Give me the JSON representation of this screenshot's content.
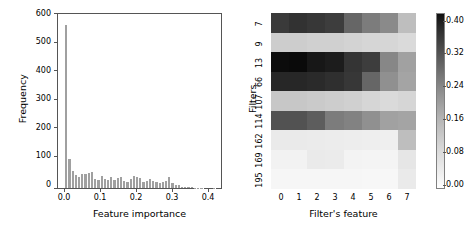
{
  "figure": {
    "panels": [
      "histogram",
      "heatmap"
    ],
    "background_color": "#ffffff"
  },
  "chart_data": [
    {
      "type": "bar",
      "subtype": "histogram",
      "title": "",
      "xlabel": "Feature importance",
      "ylabel": "Frequency",
      "xlim": [
        -0.02,
        0.44
      ],
      "ylim": [
        0,
        620
      ],
      "xticks": [
        "0.0",
        "0.1",
        "0.2",
        "0.3",
        "0.4"
      ],
      "xtick_values": [
        0.0,
        0.1,
        0.2,
        0.3,
        0.4
      ],
      "yticks": [
        "0",
        "100",
        "200",
        "300",
        "400",
        "500",
        "600"
      ],
      "ytick_values": [
        0,
        100,
        200,
        300,
        400,
        500,
        600
      ],
      "grid": false,
      "legend": null,
      "bar_color": "#a0a0a0",
      "bin_edges": [
        0.0,
        0.009,
        0.018,
        0.027,
        0.036,
        0.045,
        0.054,
        0.063,
        0.072,
        0.081,
        0.09,
        0.099,
        0.108,
        0.117,
        0.126,
        0.135,
        0.144,
        0.153,
        0.162,
        0.171,
        0.18,
        0.189,
        0.198,
        0.207,
        0.216,
        0.225,
        0.234,
        0.243,
        0.252,
        0.261,
        0.27,
        0.279,
        0.288,
        0.297,
        0.306,
        0.315,
        0.324,
        0.333,
        0.342,
        0.351,
        0.36,
        0.369,
        0.378,
        0.387,
        0.396,
        0.405,
        0.414,
        0.423
      ],
      "values": [
        580,
        105,
        62,
        47,
        38,
        50,
        50,
        55,
        57,
        33,
        29,
        42,
        32,
        29,
        38,
        30,
        34,
        40,
        26,
        20,
        32,
        43,
        41,
        34,
        22,
        25,
        33,
        24,
        23,
        19,
        22,
        26,
        38,
        18,
        10,
        11,
        4,
        3,
        4,
        2,
        1,
        1,
        1,
        0,
        0,
        0,
        1
      ]
    },
    {
      "type": "heatmap",
      "title": "",
      "xlabel": "Filter's feature",
      "ylabel": "Filters",
      "xticks": [
        "0",
        "1",
        "2",
        "3",
        "4",
        "5",
        "6",
        "7"
      ],
      "yticks": [
        "7",
        "9",
        "13",
        "66",
        "107",
        "114",
        "162",
        "169",
        "195"
      ],
      "colorbar": {
        "ticks": [
          "0.00",
          "0.08",
          "0.16",
          "0.24",
          "0.32",
          "0.40"
        ],
        "tick_values": [
          0.0,
          0.08,
          0.16,
          0.24,
          0.32,
          0.4
        ],
        "vmin": 0.0,
        "vmax": 0.43,
        "colormap": "Greys"
      },
      "rows": [
        {
          "label": "7",
          "values": [
            0.335,
            0.35,
            0.34,
            0.33,
            0.255,
            0.215,
            0.19,
            0.1
          ]
        },
        {
          "label": "9",
          "values": [
            0.075,
            0.075,
            0.07,
            0.07,
            0.065,
            0.06,
            0.06,
            0.055
          ]
        },
        {
          "label": "13",
          "values": [
            0.42,
            0.425,
            0.4,
            0.39,
            0.345,
            0.33,
            0.195,
            0.15
          ]
        },
        {
          "label": "66",
          "values": [
            0.37,
            0.37,
            0.365,
            0.355,
            0.34,
            0.255,
            0.18,
            0.145
          ]
        },
        {
          "label": "107",
          "values": [
            0.085,
            0.085,
            0.08,
            0.075,
            0.07,
            0.06,
            0.055,
            0.06
          ]
        },
        {
          "label": "114",
          "values": [
            0.29,
            0.29,
            0.27,
            0.215,
            0.205,
            0.18,
            0.15,
            0.145
          ]
        },
        {
          "label": "162",
          "values": [
            0.03,
            0.03,
            0.028,
            0.026,
            0.025,
            0.024,
            0.022,
            0.1
          ]
        },
        {
          "label": "169",
          "values": [
            0.018,
            0.018,
            0.03,
            0.028,
            0.016,
            0.015,
            0.014,
            0.035
          ]
        },
        {
          "label": "195",
          "values": [
            0.012,
            0.012,
            0.012,
            0.012,
            0.011,
            0.01,
            0.01,
            0.03
          ]
        }
      ]
    }
  ]
}
